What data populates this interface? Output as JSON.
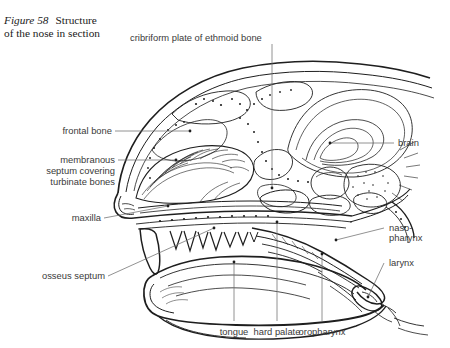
{
  "figure": {
    "caption_label": "Figure 58",
    "caption_text": "Structure of the nose in section",
    "caption_line1_prefix": "Figure 58",
    "caption_line1_rest": "Structure",
    "caption_line2": "of the nose in section"
  },
  "labels": {
    "cribriform": "cribriform plate of ethmoid bone",
    "frontal_bone": "frontal bone",
    "membranous_l1": "membranous",
    "membranous_l2": "septum covering",
    "membranous_l3": "turbinate bones",
    "maxilla": "maxilla",
    "osseus_septum": "osseus septum",
    "brain": "brain",
    "nasopharynx_l1": "naso-",
    "nasopharynx_l2": "pharynx",
    "larynx": "larynx",
    "tongue": "tongue",
    "hard_palate": "hard palate",
    "oropharynx": "oropharynx"
  },
  "colors": {
    "background": "#ffffff",
    "ink": "#1e1e1e",
    "label_text": "#3a3a3a",
    "leader": "#6d6d6d",
    "caption_text": "#1a1a1a"
  }
}
